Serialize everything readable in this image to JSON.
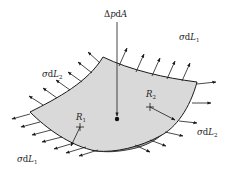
{
  "figure": {
    "type": "membrane-surface-tension-diagram",
    "colors": {
      "surface_fill": "#d9d9d9",
      "underside_fill": "#a8a8a8",
      "stroke": "#1a1a1a",
      "background": "#ffffff"
    },
    "labels": {
      "pressure": {
        "delta": "Δ",
        "p": "p",
        "d": "d",
        "A": "A"
      },
      "sigma_dL1_top": {
        "sigma": "σ",
        "d": "d",
        "L": "L",
        "sub": "1"
      },
      "sigma_dL2_left": {
        "sigma": "σ",
        "d": "d",
        "L": "L",
        "sub": "2"
      },
      "sigma_dL2_right": {
        "sigma": "σ",
        "d": "d",
        "L": "L",
        "sub": "2"
      },
      "sigma_dL1_bottom": {
        "sigma": "σ",
        "d": "d",
        "L": "L",
        "sub": "1"
      },
      "R1": {
        "R": "R",
        "sub": "1"
      },
      "R2": {
        "R": "R",
        "sub": "2"
      }
    }
  }
}
